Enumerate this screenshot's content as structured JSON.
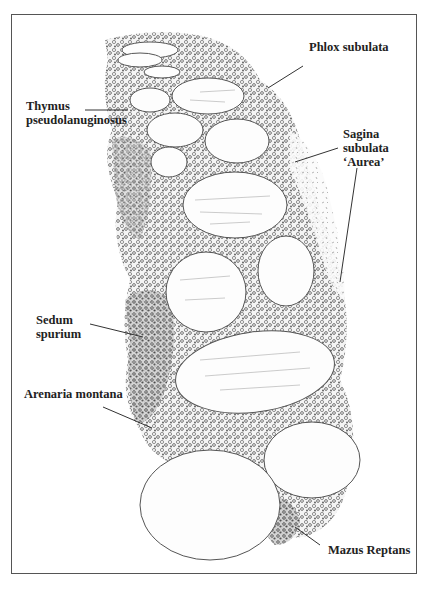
{
  "figure": {
    "labels": [
      {
        "id": "phlox",
        "lines": [
          "Phlox subulata"
        ]
      },
      {
        "id": "thymus",
        "lines": [
          "Thymus",
          "pseudolanuginosus"
        ]
      },
      {
        "id": "sagina",
        "lines": [
          "Sagina",
          "subulata",
          "‘Aurea’"
        ]
      },
      {
        "id": "sedum",
        "lines": [
          "Sedum",
          "spurium"
        ]
      },
      {
        "id": "arenaria",
        "lines": [
          "Arenaria montana"
        ]
      },
      {
        "id": "mazus",
        "lines": [
          "Mazus Reptans"
        ]
      }
    ]
  }
}
